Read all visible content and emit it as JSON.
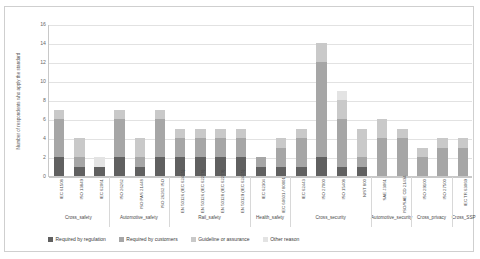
{
  "chart_data": {
    "type": "bar",
    "stacked": true,
    "title": "",
    "xlabel": "",
    "ylabel": "Number of respondents who apply the standard",
    "ylim": [
      0,
      16
    ],
    "yticks": [
      0,
      2,
      4,
      6,
      8,
      10,
      12,
      14,
      16
    ],
    "grid": true,
    "legend_position": "bottom",
    "categories": [
      "IEC 61508",
      "ISO 13849",
      "IEC 62061",
      "ISO 26262",
      "ISO PAS 21448",
      "ISO 26262 ISO",
      "EN 50126 (IEC 62425)",
      "EN 50126 (IEC 62278)",
      "EN 50128 (IEC 62279)",
      "EN 50129 (IEC 62425)",
      "IEC 62304",
      "IEC 60601 / 80001",
      "IEC 62443",
      "ISO 27000",
      "ISO 15408",
      "NIST 800",
      "SAE J3061",
      "ISO/SAE CD 21434",
      "ISO 29100",
      "ISO 27500",
      "IEC TR 63069"
    ],
    "series": [
      {
        "name": "Required by regulation",
        "color": "#606060",
        "values": [
          2,
          1,
          1,
          2,
          1,
          2,
          2,
          2,
          2,
          2,
          1,
          1,
          1,
          2,
          1,
          1,
          0,
          0,
          0,
          0,
          0
        ]
      },
      {
        "name": "Required by customers",
        "color": "#a6a6a6",
        "values": [
          4,
          1,
          0,
          4,
          1,
          4,
          2,
          2,
          2,
          2,
          1,
          2,
          3,
          10,
          5,
          1,
          4,
          4,
          2,
          3,
          3
        ]
      },
      {
        "name": "Guideline or assurance",
        "color": "#c9c9c9",
        "values": [
          1,
          2,
          0,
          1,
          2,
          1,
          1,
          1,
          1,
          1,
          0,
          1,
          1,
          2,
          2,
          3,
          2,
          1,
          1,
          1,
          1
        ]
      },
      {
        "name": "Other reason",
        "color": "#e3e3e3",
        "values": [
          0,
          0,
          1,
          0,
          0,
          0,
          0,
          0,
          0,
          0,
          0,
          0,
          0,
          0,
          1,
          0,
          0,
          0,
          0,
          0,
          0
        ]
      }
    ],
    "groups": [
      {
        "label": "Cross_safety",
        "start": 0,
        "end": 2
      },
      {
        "label": "Automotive_safety",
        "start": 3,
        "end": 5
      },
      {
        "label": "Rail_safety",
        "start": 6,
        "end": 9
      },
      {
        "label": "Health_safety",
        "start": 10,
        "end": 11
      },
      {
        "label": "Cross_security",
        "start": 12,
        "end": 15
      },
      {
        "label": "Automotive_security",
        "start": 16,
        "end": 17
      },
      {
        "label": "Cross_privacy",
        "start": 18,
        "end": 19
      },
      {
        "label": "Cross_SSP",
        "start": 20,
        "end": 20
      }
    ]
  }
}
